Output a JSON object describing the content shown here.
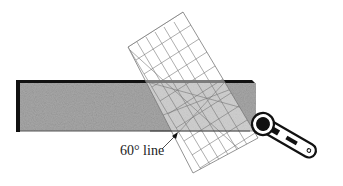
{
  "diagram": {
    "annotation": {
      "text": "60° line"
    },
    "elements": {
      "fabric_strip": "gray textured fabric strip",
      "ruler": "transparent gridded quilting ruler, rotated",
      "cutter": "rotary cutter"
    },
    "colors": {
      "fabric": "#a8a8a8",
      "fabric_edge": "#111111",
      "ruler_grid": "#777777",
      "cutter": "#111111"
    }
  }
}
